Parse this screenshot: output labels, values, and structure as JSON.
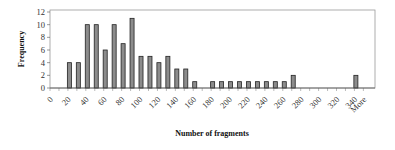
{
  "chart_data": {
    "type": "bar",
    "title": "",
    "xlabel": "Number of fragments",
    "ylabel": "Frequency",
    "ylim": [
      0,
      12
    ],
    "yticks": [
      0,
      2,
      4,
      6,
      8,
      10,
      12
    ],
    "grid": false,
    "legend": "none",
    "categories": [
      "0",
      "10",
      "20",
      "30",
      "40",
      "50",
      "60",
      "70",
      "80",
      "90",
      "100",
      "110",
      "120",
      "130",
      "140",
      "150",
      "160",
      "170",
      "180",
      "190",
      "200",
      "210",
      "220",
      "230",
      "240",
      "250",
      "260",
      "270",
      "280",
      "290",
      "300",
      "310",
      "320",
      "330",
      "340",
      "More"
    ],
    "xtick_labels": [
      "0",
      "20",
      "40",
      "60",
      "80",
      "100",
      "120",
      "140",
      "160",
      "180",
      "200",
      "220",
      "240",
      "260",
      "280",
      "300",
      "320",
      "340",
      "More"
    ],
    "values": [
      0,
      0,
      4,
      4,
      10,
      10,
      6,
      10,
      7,
      11,
      5,
      5,
      4,
      5,
      3,
      3,
      1,
      0,
      1,
      1,
      1,
      1,
      1,
      1,
      1,
      1,
      1,
      2,
      0,
      0,
      0,
      0,
      0,
      0,
      2,
      0
    ],
    "colors": {
      "bar_fill": "#8c8c8c",
      "bar_stroke": "#222222",
      "frame": "#999999"
    }
  }
}
